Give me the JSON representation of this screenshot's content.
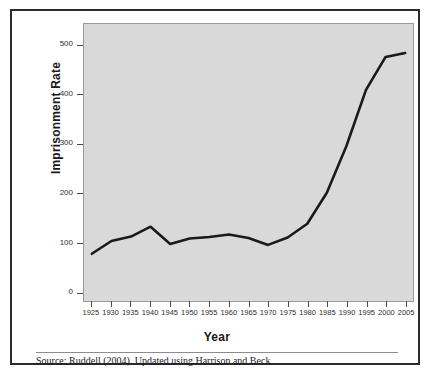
{
  "figure": {
    "source_note": "Source: Ruddell (2004). Updated using Harrison and Beck",
    "plot_bg": "#d9d9d9",
    "line_color": "#1a1a1a",
    "frame_color": "#2b2b2b"
  },
  "chart_data": {
    "type": "line",
    "title": "",
    "xlabel": "Year",
    "ylabel": "Imprisonment Rate",
    "x": [
      1925,
      1930,
      1935,
      1940,
      1945,
      1950,
      1955,
      1960,
      1965,
      1970,
      1975,
      1980,
      1985,
      1990,
      1995,
      2000,
      2005
    ],
    "xticklabels": [
      "1925",
      "1930",
      "1935",
      "1940",
      "1945",
      "1950",
      "1955",
      "1960",
      "1965",
      "1970",
      "1975",
      "1980",
      "1985",
      "1990",
      "1995",
      "2000",
      "2005"
    ],
    "yticks": [
      0,
      100,
      200,
      300,
      400,
      500
    ],
    "yticklabels": [
      "0",
      "100",
      "200",
      "300",
      "400",
      "500"
    ],
    "xlim": [
      1923,
      2007
    ],
    "ylim": [
      -18,
      545
    ],
    "grid": false,
    "legend": null,
    "series": [
      {
        "name": "Imprisonment Rate",
        "values": [
          78,
          104,
          113,
          133,
          98,
          109,
          112,
          117,
          110,
          96,
          111,
          139,
          202,
          297,
          411,
          478,
          486
        ]
      }
    ]
  }
}
